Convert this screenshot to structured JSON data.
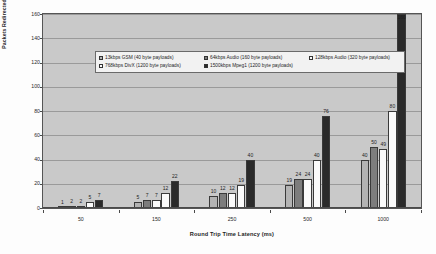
{
  "chart_data": {
    "type": "bar",
    "title": "",
    "xlabel": "Round Trip Time Latency (ms)",
    "ylabel": "Packets Redirected",
    "categories": [
      "50",
      "150",
      "250",
      "500",
      "1000"
    ],
    "ylim": [
      0,
      160
    ],
    "yticks": [
      "0",
      "20",
      "40",
      "60",
      "80",
      "100",
      "120",
      "140",
      "160"
    ],
    "grid": true,
    "legend_position": "upper-left-inside",
    "series": [
      {
        "name": "13kbps GSM (40 byte payloads)",
        "color": "#b3b3b3",
        "values": [
          1,
          5,
          10,
          19,
          40
        ]
      },
      {
        "name": "64kbps Audio (160 byte payloads)",
        "color": "#7d7d7d",
        "values": [
          2,
          7,
          12,
          24,
          50
        ]
      },
      {
        "name": "128kbps Audio (320 byte payloads)",
        "color": "#fafafa",
        "values": [
          2,
          7,
          12,
          24,
          49
        ]
      },
      {
        "name": "768kbps DivX (1200 byte payloads)",
        "color": "#fafafa",
        "values": [
          5,
          12,
          19,
          40,
          80
        ]
      },
      {
        "name": "1500kbps Mpeg1 (1200 byte payloads)",
        "color": "#2a2a2a",
        "values": [
          7,
          22,
          40,
          76,
          160
        ]
      }
    ]
  }
}
